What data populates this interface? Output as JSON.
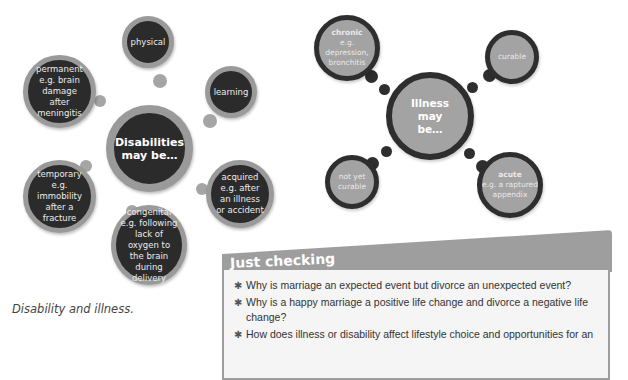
{
  "disability_diagram": {
    "center": "Disabilities may be…",
    "nodes": [
      {
        "label": "physical"
      },
      {
        "label": "learning"
      },
      {
        "label": "permanent e.g. brain damage after meningitis"
      },
      {
        "label": "temporary e.g. immobility after a fracture"
      },
      {
        "label": "acquired e.g. after an illness or accident"
      },
      {
        "label": "congenital e.g. following lack of oxygen to the brain during delivery"
      }
    ]
  },
  "illness_diagram": {
    "center": "Illness may be…",
    "nodes": [
      {
        "title": "chronic",
        "detail": "e.g. depression, bronchitis"
      },
      {
        "title": "",
        "detail": "curable"
      },
      {
        "title": "",
        "detail": "not yet curable"
      },
      {
        "title": "acute",
        "detail": "e.g. a raptured appendix"
      }
    ]
  },
  "caption": "Disability and illness.",
  "just_checking": {
    "title": "Just checking",
    "questions": [
      "Why is marriage an expected event but divorce an unexpected event?",
      "Why is a happy marriage a positive life change and divorce a negative life change?",
      "How does illness or disability affect lifestyle choice and opportunities for an"
    ]
  }
}
